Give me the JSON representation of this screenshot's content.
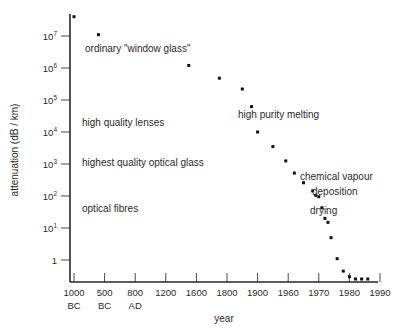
{
  "chart_data": {
    "type": "scatter",
    "title": "",
    "xlabel": "year",
    "ylabel": "attenuation (dB / km)",
    "log_y": true,
    "ylim": [
      0.2,
      50000000
    ],
    "y_ticks": [
      {
        "label": "10",
        "exp": "7",
        "value": 10000000
      },
      {
        "label": "10",
        "exp": "6",
        "value": 1000000
      },
      {
        "label": "10",
        "exp": "5",
        "value": 100000
      },
      {
        "label": "10",
        "exp": "4",
        "value": 10000
      },
      {
        "label": "10",
        "exp": "3",
        "value": 1000
      },
      {
        "label": "10",
        "exp": "2",
        "value": 100
      },
      {
        "label": "10",
        "exp": "1",
        "value": 10
      },
      {
        "label": "1",
        "exp": "",
        "value": 1
      }
    ],
    "x_ticks": [
      {
        "label": "1000",
        "sub": "BC"
      },
      {
        "label": "500",
        "sub": "BC"
      },
      {
        "label": "800",
        "sub": "AD"
      },
      {
        "label": "1200",
        "sub": ""
      },
      {
        "label": "1600",
        "sub": ""
      },
      {
        "label": "1800",
        "sub": ""
      },
      {
        "label": "1900",
        "sub": ""
      },
      {
        "label": "1960",
        "sub": ""
      },
      {
        "label": "1970",
        "sub": ""
      },
      {
        "label": "1980",
        "sub": ""
      },
      {
        "label": "1990",
        "sub": ""
      }
    ],
    "points": [
      {
        "year": "1000 BC",
        "attenuation": 40000000
      },
      {
        "year": "700 BC",
        "attenuation": 11000000
      },
      {
        "year": "1500",
        "attenuation": 1200000
      },
      {
        "year": "1750",
        "attenuation": 480000
      },
      {
        "year": "1850",
        "attenuation": 220000
      },
      {
        "year": "1880",
        "attenuation": 62000
      },
      {
        "year": "1900",
        "attenuation": 10000
      },
      {
        "year": "1930",
        "attenuation": 3500
      },
      {
        "year": "1955",
        "attenuation": 1250
      },
      {
        "year": "1962",
        "attenuation": 520
      },
      {
        "year": "1965",
        "attenuation": 260
      },
      {
        "year": "1968",
        "attenuation": 145
      },
      {
        "year": "1969",
        "attenuation": 105
      },
      {
        "year": "1970",
        "attenuation": 95
      },
      {
        "year": "1971",
        "attenuation": 43
      },
      {
        "year": "1972",
        "attenuation": 20
      },
      {
        "year": "1973",
        "attenuation": 15
      },
      {
        "year": "1974",
        "attenuation": 5
      },
      {
        "year": "1976",
        "attenuation": 1.1
      },
      {
        "year": "1978",
        "attenuation": 0.45
      },
      {
        "year": "1980",
        "attenuation": 0.3
      },
      {
        "year": "1982",
        "attenuation": 0.25
      },
      {
        "year": "1984",
        "attenuation": 0.24
      },
      {
        "year": "1986",
        "attenuation": 0.24
      }
    ],
    "annotations": [
      {
        "text": "ordinary \"window glass\"",
        "x": 85,
        "y": 52
      },
      {
        "text": "high quality lenses",
        "x": 82,
        "y": 126
      },
      {
        "text": "highest quality optical glass",
        "x": 82,
        "y": 166
      },
      {
        "text": "optical fibres",
        "x": 82,
        "y": 212
      },
      {
        "text": "high purity melting",
        "x": 238,
        "y": 118
      },
      {
        "text": "chemical vapour",
        "x": 300,
        "y": 180
      },
      {
        "text": "deposition",
        "x": 312,
        "y": 195
      },
      {
        "text": "drying",
        "x": 310,
        "y": 214
      }
    ]
  },
  "colors": {
    "background": "#ffffff",
    "axis": "#262626",
    "point": "#111111",
    "text": "#2b2b2b"
  }
}
